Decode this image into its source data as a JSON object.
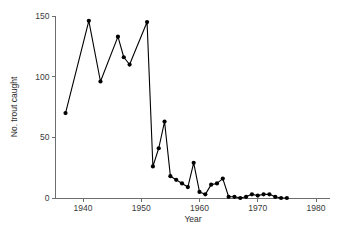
{
  "chart_data": {
    "type": "line",
    "title": "",
    "subtitle": "",
    "xlabel": "Year",
    "ylabel": "No. trout caught",
    "xlim": [
      1935,
      1981
    ],
    "ylim": [
      0,
      152
    ],
    "xticks": [
      1940,
      1950,
      1960,
      1970,
      1980
    ],
    "xtick_labels": [
      "1940",
      "1950",
      "1960",
      "1970",
      "1980"
    ],
    "yticks": [
      0,
      50,
      100,
      150
    ],
    "ytick_labels": [
      "0",
      "50",
      "100",
      "150"
    ],
    "grid": false,
    "legend": null,
    "marker": "filled-circle",
    "line_color": "#000000",
    "marker_color": "#000000",
    "axis_color": "#6d6d6d",
    "background_color": "#ffffff",
    "x": [
      1937,
      1941,
      1943,
      1946,
      1947,
      1948,
      1951,
      1952,
      1953,
      1954,
      1955,
      1956,
      1957,
      1958,
      1959,
      1960,
      1961,
      1962,
      1963,
      1964,
      1965,
      1966,
      1967,
      1968,
      1969,
      1970,
      1971,
      1972,
      1973,
      1974,
      1975
    ],
    "values": [
      70,
      146,
      96,
      133,
      116,
      110,
      145,
      26,
      41,
      63,
      18,
      15,
      12,
      9,
      29,
      5,
      3,
      11,
      12,
      16,
      1,
      1,
      0,
      1,
      3,
      2,
      3,
      3,
      1,
      0,
      0
    ],
    "series": [
      {
        "name": "No. trout caught",
        "values": [
          70,
          146,
          96,
          133,
          116,
          110,
          145,
          26,
          41,
          63,
          18,
          15,
          12,
          9,
          29,
          5,
          3,
          11,
          12,
          16,
          1,
          1,
          0,
          1,
          3,
          2,
          3,
          3,
          1,
          0,
          0
        ]
      }
    ]
  }
}
